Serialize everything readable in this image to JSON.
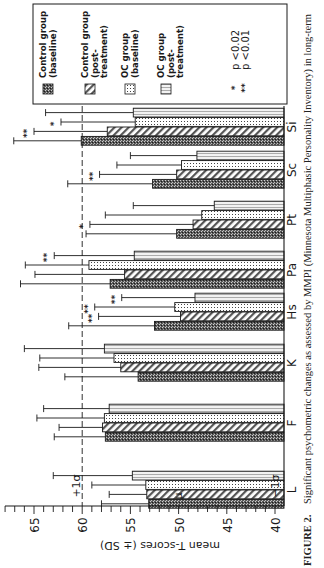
{
  "figure": {
    "caption_label": "FIGURE 2.",
    "caption_text": "Significant psychometric changes as assessed by MMPI (Minnesota Multiphasic Personality Inventory) in long-term"
  },
  "legend": {
    "items": [
      {
        "label_line1": "Control group",
        "label_line2": "(baseline)",
        "label_line3": "",
        "pattern": "dense-dots-dark"
      },
      {
        "label_line1": "Control group",
        "label_line2": "(post-",
        "label_line3": "treatment)",
        "pattern": "diagonal-stripes"
      },
      {
        "label_line1": "OC group",
        "label_line2": "(baseline)",
        "label_line3": "",
        "pattern": "sparse-dots"
      },
      {
        "label_line1": "OC group",
        "label_line2": "(post-",
        "label_line3": "treatment)",
        "pattern": "vertical-lines-light"
      }
    ],
    "significance": [
      {
        "marker": "*",
        "text": "p <0.02"
      },
      {
        "marker": "**",
        "text": "p <0.01"
      }
    ]
  },
  "reference_lines": {
    "plus_sigma_label": "+1σ",
    "mu_label": "μ",
    "minus_sigma_label": "−1σ",
    "plus_sigma_value": 60
  },
  "colors": {
    "ink": "#1a1a1a",
    "paper": "#ffffff",
    "bar_dark": "#3a3a3a",
    "bar_mid": "#9a9a9a",
    "bar_light": "#d8d8d8"
  },
  "chart_data": {
    "type": "bar",
    "orientation": "rotated 90° clockwise (bars extend leftward on page)",
    "title": "Significant psychometric changes as assessed by MMPI",
    "xlabel": "",
    "ylabel": "mean T-scores (± SD)",
    "ylim": [
      40,
      67
    ],
    "yticks": [
      40,
      45,
      50,
      55,
      60,
      65
    ],
    "grid": false,
    "legend_position": "top (page), inside box",
    "categories": [
      "L",
      "F",
      "K",
      "Hs",
      "Pa",
      "Pt",
      "Sc",
      "Si"
    ],
    "series": [
      {
        "name": "Control group (baseline)",
        "values": [
          53.1,
          57.6,
          54.2,
          52.5,
          57.1,
          50.2,
          52.7,
          60.1
        ],
        "error_top": [
          58.0,
          62.9,
          61.8,
          61.4,
          66.4,
          59.6,
          61.5,
          67.1
        ],
        "significance": [
          "",
          "",
          "",
          "",
          "",
          "",
          "",
          ""
        ]
      },
      {
        "name": "Control group (post-treatment)",
        "values": [
          53.3,
          57.9,
          56.0,
          49.8,
          55.6,
          48.5,
          50.2,
          57.4
        ],
        "error_top": [
          57.2,
          62.4,
          64.5,
          58.3,
          64.9,
          59.2,
          58.2,
          65.0
        ],
        "significance": [
          "",
          "",
          "",
          "**",
          "",
          "*",
          "**",
          "**"
        ]
      },
      {
        "name": "OC group (baseline)",
        "values": [
          53.4,
          57.7,
          56.7,
          50.4,
          59.3,
          47.6,
          49.7,
          54.5
        ],
        "error_top": [
          59.0,
          64.7,
          64.4,
          58.7,
          65.9,
          57.6,
          56.4,
          62.2
        ],
        "significance": [
          "",
          "",
          "",
          "**",
          "",
          "",
          "",
          "*"
        ]
      },
      {
        "name": "OC group (post-treatment)",
        "values": [
          54.8,
          57.2,
          57.7,
          48.3,
          54.6,
          46.3,
          48.1,
          54.7
        ],
        "error_top": [
          63.0,
          64.0,
          66.0,
          55.9,
          62.9,
          54.7,
          55.0,
          63.8
        ],
        "significance": [
          "",
          "",
          "",
          "**",
          "**",
          "",
          "",
          ""
        ]
      }
    ]
  }
}
